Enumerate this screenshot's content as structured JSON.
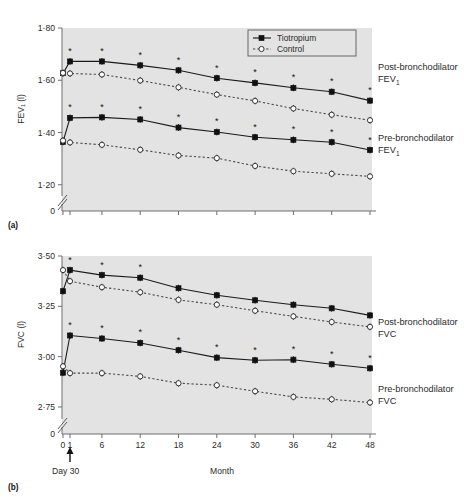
{
  "figure": {
    "panel_a_letter": "(a)",
    "panel_b_letter": "(b)",
    "legend": {
      "items": [
        {
          "label": "Tiotropium",
          "marker": "filled-square",
          "line": "solid",
          "color": "#111111"
        },
        {
          "label": "Control",
          "marker": "open-circle",
          "line": "dotted",
          "color": "#333333"
        }
      ]
    },
    "xaxis": {
      "title": "Month",
      "tick_labels": [
        "0",
        "1",
        "6",
        "12",
        "18",
        "24",
        "30",
        "36",
        "42",
        "48"
      ],
      "day30_annotation": "Day 30"
    },
    "annotations": {
      "a_post": "Post-bronchodilator",
      "a_post_sub": "FEV",
      "a_post_sub_idx": "1",
      "a_pre": "Pre-bronchodilator",
      "a_pre_sub": "FEV",
      "a_pre_sub_idx": "1",
      "b_post": "Post-bronchodilator",
      "b_post_sub": "FVC",
      "b_pre": "Pre-bronchodilator",
      "b_pre_sub": "FVC"
    },
    "significance_marker": "*"
  },
  "chart_data": [
    {
      "id": "panel-a",
      "type": "line",
      "title": "",
      "ylabel": "FEV₁ (l)",
      "xlabel": "Month",
      "ytick_labels": [
        "0",
        "1·20",
        "1·40",
        "1·60",
        "1·80"
      ],
      "ytick_values": [
        0,
        1.2,
        1.4,
        1.6,
        1.8
      ],
      "ylim": [
        1.18,
        1.8
      ],
      "axis_break": true,
      "x": [
        0,
        1,
        6,
        12,
        18,
        24,
        30,
        36,
        42,
        48
      ],
      "series": [
        {
          "name": "Post-bronchodilator FEV1 — Tiotropium",
          "marker": "filled-square",
          "line": "solid",
          "values": [
            1.627,
            1.672,
            1.672,
            1.657,
            1.638,
            1.608,
            1.59,
            1.571,
            1.556,
            1.522
          ],
          "starred": [
            false,
            true,
            true,
            true,
            true,
            true,
            true,
            true,
            true,
            true
          ]
        },
        {
          "name": "Post-bronchodilator FEV1 — Control",
          "marker": "open-circle",
          "line": "dotted",
          "values": [
            1.628,
            1.626,
            1.622,
            1.599,
            1.573,
            1.545,
            1.521,
            1.492,
            1.468,
            1.447
          ],
          "starred": [
            false,
            false,
            false,
            false,
            false,
            false,
            false,
            false,
            false,
            false
          ]
        },
        {
          "name": "Pre-bronchodilator FEV1 — Tiotropium",
          "marker": "filled-square",
          "line": "solid",
          "values": [
            1.364,
            1.456,
            1.458,
            1.45,
            1.419,
            1.402,
            1.382,
            1.372,
            1.363,
            1.333
          ],
          "starred": [
            false,
            true,
            true,
            true,
            true,
            true,
            true,
            true,
            true,
            true
          ]
        },
        {
          "name": "Pre-bronchodilator FEV1 — Control",
          "marker": "open-circle",
          "line": "dotted",
          "values": [
            1.369,
            1.362,
            1.353,
            1.334,
            1.312,
            1.302,
            1.272,
            1.252,
            1.242,
            1.232
          ],
          "starred": [
            false,
            false,
            false,
            false,
            false,
            false,
            false,
            false,
            false,
            false
          ]
        }
      ]
    },
    {
      "id": "panel-b",
      "type": "line",
      "title": "",
      "ylabel": "FVC (l)",
      "xlabel": "Month",
      "ytick_labels": [
        "0",
        "2·75",
        "3·00",
        "3·25",
        "3·50"
      ],
      "ytick_values": [
        0,
        2.75,
        3.0,
        3.25,
        3.5
      ],
      "ylim": [
        2.72,
        3.5
      ],
      "axis_break": true,
      "x": [
        0,
        1,
        6,
        12,
        18,
        24,
        30,
        36,
        42,
        48
      ],
      "series": [
        {
          "name": "Post-bronchodilator FVC — Tiotropium",
          "marker": "filled-square",
          "line": "solid",
          "values": [
            3.325,
            3.43,
            3.405,
            3.392,
            3.34,
            3.305,
            3.28,
            3.258,
            3.24,
            3.205
          ],
          "starred": [
            false,
            true,
            true,
            true,
            false,
            false,
            false,
            false,
            false,
            false
          ]
        },
        {
          "name": "Post-bronchodilator FVC — Control",
          "marker": "open-circle",
          "line": "dotted",
          "values": [
            3.43,
            3.375,
            3.345,
            3.32,
            3.282,
            3.258,
            3.228,
            3.2,
            3.172,
            3.148
          ],
          "starred": [
            false,
            false,
            false,
            false,
            false,
            false,
            false,
            false,
            false,
            false
          ]
        },
        {
          "name": "Pre-bronchodilator FVC — Tiotropium",
          "marker": "filled-square",
          "line": "solid",
          "values": [
            2.92,
            3.105,
            3.09,
            3.068,
            3.032,
            2.995,
            2.982,
            2.985,
            2.962,
            2.942
          ],
          "starred": [
            false,
            true,
            true,
            true,
            true,
            true,
            true,
            true,
            true,
            true
          ]
        },
        {
          "name": "Pre-bronchodilator FVC — Control",
          "marker": "open-circle",
          "line": "dotted",
          "values": [
            2.952,
            2.918,
            2.918,
            2.902,
            2.868,
            2.858,
            2.828,
            2.8,
            2.788,
            2.772
          ],
          "starred": [
            false,
            false,
            false,
            false,
            false,
            false,
            false,
            false,
            false,
            false
          ]
        }
      ]
    }
  ]
}
